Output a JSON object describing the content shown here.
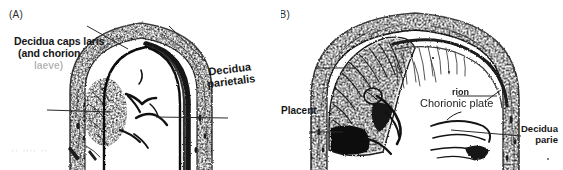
{
  "figure": {
    "type": "two-panel anatomical line drawing",
    "background_color": "#ffffff",
    "ink_color": "#161616"
  },
  "panels": [
    {
      "id": "A",
      "label": "(A)",
      "subject": "uterus-longitudinal-section-early-pregnancy",
      "annotations": [
        {
          "name": "decidua-capsularis",
          "line1": "Decidua caps  laris",
          "line2": "(and chorion",
          "line3": "laeve)"
        },
        {
          "name": "decidua-parietalis",
          "line1": "Decidua",
          "line2": "parietalis"
        }
      ],
      "smudge_text": "'' ''''  ''"
    },
    {
      "id": "B",
      "label": "(B)",
      "subject": "uterus-longitudinal-section-late-pregnancy",
      "annotations": [
        {
          "name": "placenta",
          "line1": "Placent"
        },
        {
          "name": "chorion-fragment",
          "line1": "rion"
        },
        {
          "name": "chorionic-plate",
          "line1": "Chorionic plate"
        },
        {
          "name": "decidua-parietalis",
          "line1": "Decidua",
          "line2": "parie"
        }
      ]
    }
  ]
}
